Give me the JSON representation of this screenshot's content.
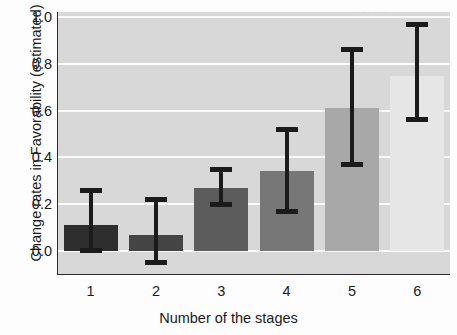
{
  "chart_data": {
    "type": "bar",
    "title": "",
    "xlabel": "Number of the stages",
    "ylabel": "Change rates in Favorability (estimated)",
    "categories": [
      "1",
      "2",
      "3",
      "4",
      "5",
      "6"
    ],
    "values": [
      0.11,
      0.07,
      0.27,
      0.34,
      0.61,
      0.75
    ],
    "error_low": [
      -0.01,
      -0.06,
      0.19,
      0.16,
      0.36,
      0.55
    ],
    "error_high": [
      0.27,
      0.23,
      0.36,
      0.53,
      0.87,
      0.98
    ],
    "ylim": [
      0.0,
      1.0
    ],
    "yticks": [
      "1.0",
      "0.8",
      "0.6",
      "0.4",
      "0.2",
      "0.0"
    ],
    "ytick_values": [
      1.0,
      0.8,
      0.6,
      0.4,
      0.2,
      0.0
    ],
    "grid": true,
    "legend": "none",
    "bar_colors": [
      "#2e2e2e",
      "#444444",
      "#5c5c5c",
      "#777777",
      "#a8a8a8",
      "#e6e6e6"
    ],
    "plot_background": "#d8d8d8",
    "error_color": "#1b1b1b",
    "gridline_color": "#fafafa"
  }
}
